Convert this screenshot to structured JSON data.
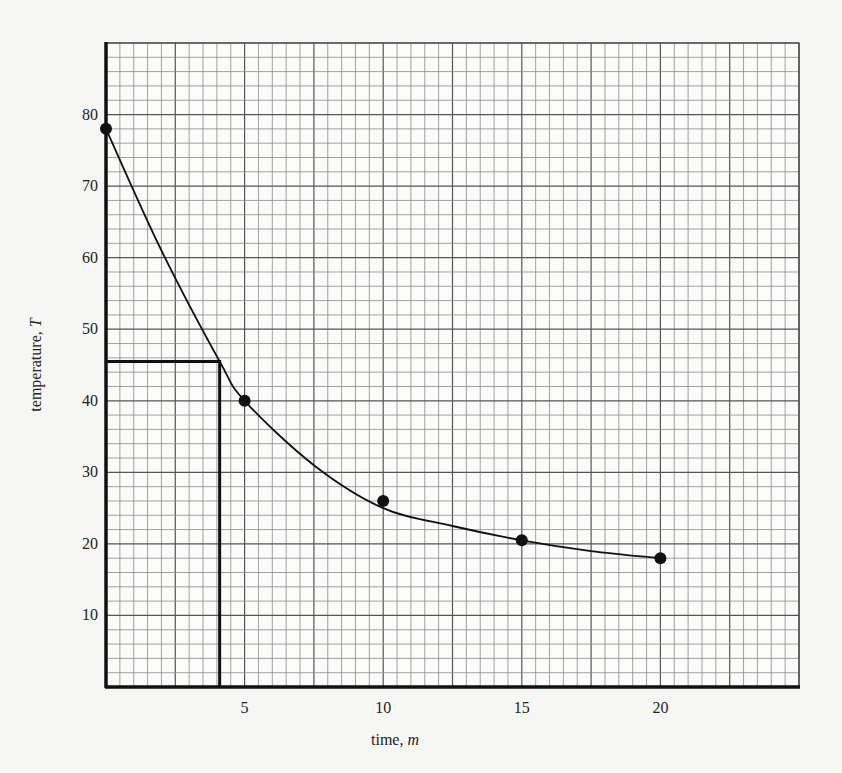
{
  "chart_data": {
    "type": "scatter",
    "title": "",
    "xlabel": "time, m",
    "xlabel_text": "time, ",
    "xlabel_var": "m",
    "ylabel": "temperature, T",
    "ylabel_text": "temperature, ",
    "ylabel_var": "T",
    "xlim": [
      0,
      25
    ],
    "ylim": [
      0,
      90
    ],
    "x_ticks": [
      5,
      10,
      15,
      20
    ],
    "y_ticks": [
      10,
      20,
      30,
      40,
      50,
      60,
      70,
      80
    ],
    "grid": {
      "on": true,
      "x_minor_step": 0.5,
      "x_major_step": 2.5,
      "y_minor_step": 2,
      "y_major_step": 10
    },
    "legend": null,
    "series": [
      {
        "name": "measured temperature",
        "marker": "filled-circle",
        "x": [
          0,
          5,
          10,
          15,
          20
        ],
        "y": [
          78,
          40,
          26,
          20.5,
          18
        ]
      },
      {
        "name": "fitted curve",
        "type": "smooth-line",
        "x": [
          0,
          2,
          4.1,
          5,
          7.5,
          10,
          12.5,
          15,
          17.5,
          20
        ],
        "y": [
          78,
          61,
          45.5,
          40,
          31,
          25,
          22.5,
          20.5,
          19,
          18
        ]
      }
    ],
    "annotations": [
      {
        "type": "reference-lines",
        "description": "horizontal line from y-axis at T≈45.5 to curve, then vertical line down to x-axis at m≈4.1",
        "x": 4.1,
        "y": 45.5
      }
    ]
  }
}
